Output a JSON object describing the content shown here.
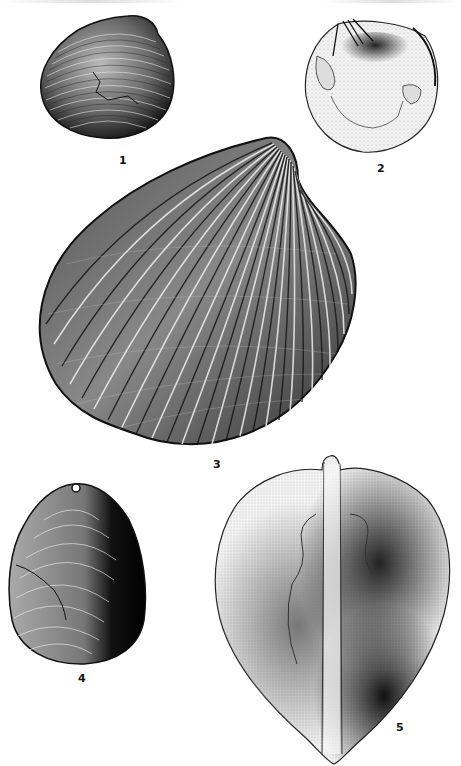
{
  "plate": {
    "type": "fossil-bivalve-illustration-plate",
    "background_color": "#ffffff",
    "ink_color": "#111111",
    "figures": [
      {
        "number": "1",
        "label": "1",
        "description": "rounded clam, exterior of valve with concentric growth lines"
      },
      {
        "number": "2",
        "label": "2",
        "description": "rounded valve, interior view showing hinge and muscle scars, stippled"
      },
      {
        "number": "3",
        "label": "3",
        "description": "large ribbed cockle-like valve, exterior view with radial ribs"
      },
      {
        "number": "4",
        "label": "4",
        "description": "ovate valve, exterior with concentric lamellae, dark shading on right"
      },
      {
        "number": "5",
        "label": "5",
        "description": "heart-shaped bivalve, dorsal/ventral view with central ridge, stippled"
      }
    ]
  }
}
